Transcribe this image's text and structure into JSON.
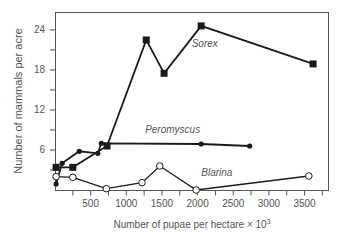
{
  "chart_data": {
    "type": "line",
    "title": "",
    "xlabel": "Number of pupae per hectare × 10",
    "xlabel_superscript": "3",
    "ylabel": "Number of mammals per acre",
    "xlim": [
      0,
      3900
    ],
    "ylim": [
      0,
      27
    ],
    "x_ticks": [
      500,
      1000,
      1500,
      2000,
      2500,
      3000,
      3500
    ],
    "x_minor_step": 250,
    "y_ticks": [
      6,
      12,
      18,
      24
    ],
    "y_minor_step": 3,
    "grid": false,
    "legend": "inline labels",
    "series": [
      {
        "name": "Sorex",
        "marker": "filled-square",
        "x": [
          15,
          250,
          730,
          1280,
          1530,
          2050,
          3620
        ],
        "y": [
          3.4,
          3.4,
          6.6,
          22.5,
          17.5,
          24.6,
          18.9
        ],
        "label_pos": [
          2100,
          21.5
        ]
      },
      {
        "name": "Peromyscus",
        "marker": "filled-circle",
        "x": [
          15,
          100,
          340,
          600,
          650,
          2050,
          2730
        ],
        "y": [
          0.9,
          4.0,
          5.8,
          5.5,
          7.0,
          6.9,
          6.6
        ],
        "label_pos": [
          1650,
          8.6
        ]
      },
      {
        "name": "Blarina",
        "marker": "open-circle",
        "x": [
          15,
          250,
          720,
          1220,
          1470,
          1980,
          3560
        ],
        "y": [
          2.0,
          1.9,
          0.2,
          1.1,
          3.6,
          0.0,
          2.1
        ],
        "label_pos": [
          2270,
          2.1
        ]
      }
    ]
  },
  "colors": {
    "line": "#1a1a1a",
    "axis": "#555555",
    "text": "#555555",
    "background": "#ffffff"
  }
}
